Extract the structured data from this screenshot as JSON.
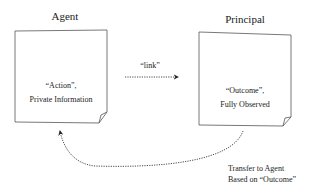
{
  "agent": {
    "title": "Agent",
    "line1": "“Action”,",
    "line2": "Private Information"
  },
  "principal": {
    "title": "Principal",
    "line1": "“Outcome”,",
    "line2": "Fully Observed"
  },
  "link_label": "“link”",
  "transfer": {
    "line1": "Transfer to Agent",
    "line2": "Based on “Outcome”"
  }
}
